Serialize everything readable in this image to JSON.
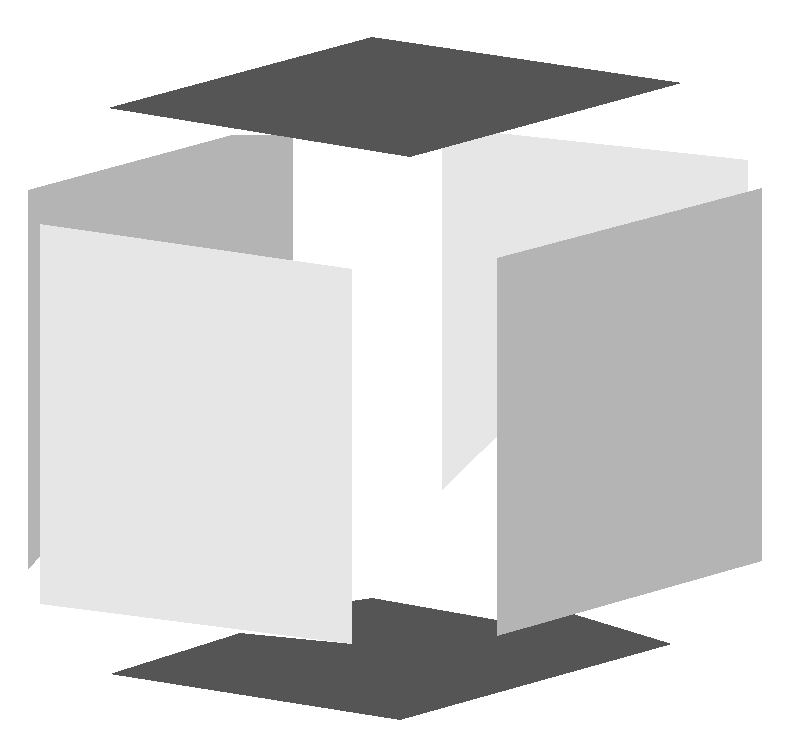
{
  "figure": {
    "description": "Exploded cube: six separated square faces arranged around an empty cube volume",
    "background": "#ffffff",
    "faces": [
      {
        "name": "back-left-face",
        "shade": "medium",
        "color": "#b4b4b4",
        "points": "28,190 232,135 293,135 293,268 28,570"
      },
      {
        "name": "back-right-face",
        "shade": "light",
        "color": "#e6e6e6",
        "points": "442,127 748,160 748,192 442,490"
      },
      {
        "name": "top-face",
        "shade": "dark",
        "color": "#555555",
        "points": "108,108 372,37 682,83 410,157"
      },
      {
        "name": "bottom-face",
        "shade": "dark",
        "color": "#555555",
        "points": "110,674 240,633 352,644 352,601 372,598 497,620 497,636 560,610 672,644 400,720"
      },
      {
        "name": "front-left-face",
        "shade": "light",
        "color": "#e6e6e6",
        "points": "40,224 352,269 352,644 40,604"
      },
      {
        "name": "front-right-face",
        "shade": "medium",
        "color": "#b4b4b4",
        "points": "497,258 762,188 762,561 497,636"
      }
    ]
  }
}
